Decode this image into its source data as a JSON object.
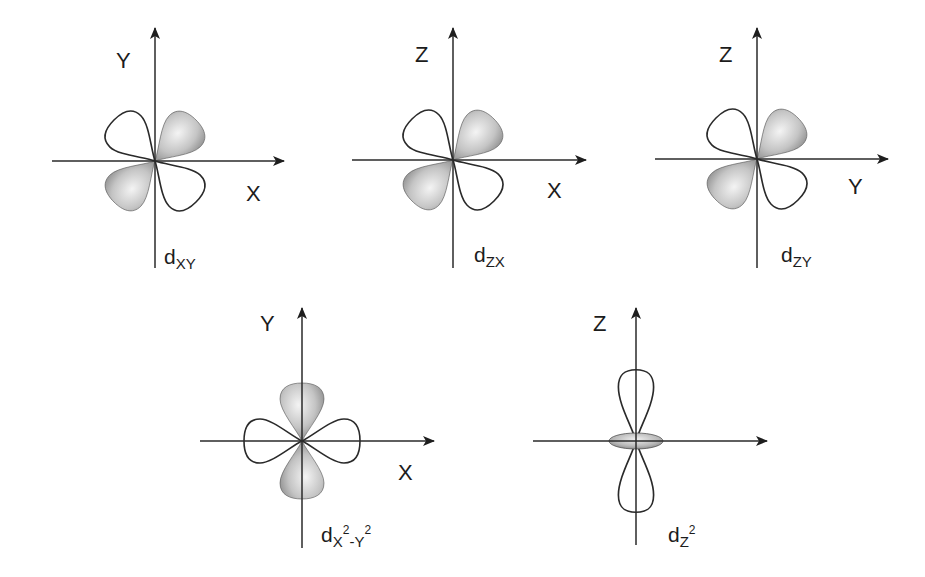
{
  "figure": {
    "diagrams": [
      {
        "id": "dxy",
        "orbital_label_main": "d",
        "orbital_label_sub": "XY",
        "vertical_axis": "Y",
        "horizontal_axis": "X"
      },
      {
        "id": "dzx",
        "orbital_label_main": "d",
        "orbital_label_sub": "ZX",
        "vertical_axis": "Z",
        "horizontal_axis": "X"
      },
      {
        "id": "dzy",
        "orbital_label_main": "d",
        "orbital_label_sub": "ZY",
        "vertical_axis": "Z",
        "horizontal_axis": "Y"
      },
      {
        "id": "dx2y2",
        "orbital_label_main": "d",
        "orbital_label_sub_a": "X",
        "orbital_label_sup_a": "2",
        "orbital_label_sub_b": "-Y",
        "orbital_label_sup_b": "2",
        "vertical_axis": "Y",
        "horizontal_axis": "X"
      },
      {
        "id": "dz2",
        "orbital_label_main": "d",
        "orbital_label_sub": "Z",
        "orbital_label_sup": "2",
        "vertical_axis": "Z",
        "horizontal_axis": ""
      }
    ]
  },
  "colors": {
    "line": "#2a2a2a",
    "lobe_shade_light": "#f2f2f2",
    "lobe_shade_dark": "#8a8a8a",
    "background": "#ffffff"
  }
}
